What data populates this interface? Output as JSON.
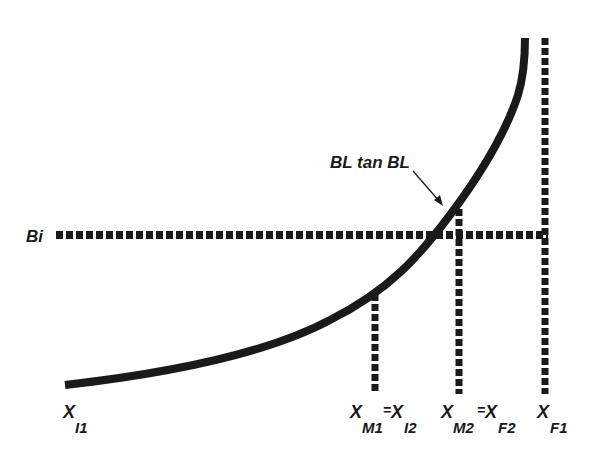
{
  "diagram": {
    "colors": {
      "ink": "#1a1a1a",
      "background": "#ffffff"
    },
    "curve_label": "BL tan BL",
    "horizontal_line_label": "Bi",
    "x_labels": [
      {
        "base": "X",
        "sub": "I1"
      },
      {
        "base": "X",
        "sub": "M1",
        "eq_base": "X",
        "eq_sub": "I2"
      },
      {
        "base": "X",
        "sub": "M2",
        "eq_base": "X",
        "eq_sub": "F2"
      },
      {
        "base": "X",
        "sub": "F1"
      }
    ],
    "equals": "="
  }
}
